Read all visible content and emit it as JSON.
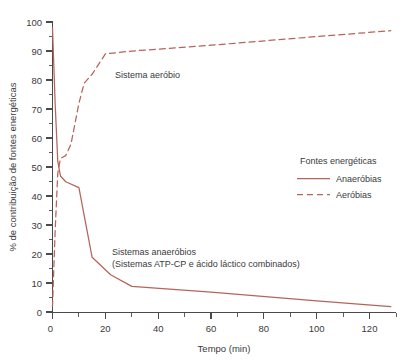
{
  "chart_data": {
    "type": "line",
    "title": "",
    "xlabel": "Tempo (min)",
    "ylabel": "% de contribuição de fontes energéticas",
    "xlim": [
      0,
      130
    ],
    "ylim": [
      0,
      100
    ],
    "grid": false,
    "xticks": [
      0,
      20,
      40,
      60,
      80,
      100,
      120
    ],
    "xtick_labels": [
      "0",
      "20",
      "40",
      "60",
      "80",
      "100",
      "120"
    ],
    "xticks_minor": [
      10,
      30,
      50,
      70,
      90,
      110
    ],
    "yticks": [
      0,
      10,
      20,
      30,
      40,
      50,
      60,
      70,
      80,
      90,
      100
    ],
    "ytick_labels": [
      "0",
      "10",
      "20",
      "30",
      "40",
      "50",
      "60",
      "70",
      "80",
      "90",
      "100"
    ],
    "yticks_minor": [
      5,
      15,
      25,
      35,
      45,
      55,
      65,
      75,
      85,
      95
    ],
    "legend_title": "Fontes energéticas",
    "legend_position": "right-middle",
    "series": [
      {
        "name": "Anaeróbias",
        "style": "solid",
        "color": "#b5645a",
        "points": [
          [
            0,
            98
          ],
          [
            1,
            72
          ],
          [
            2,
            52
          ],
          [
            3,
            47
          ],
          [
            5,
            45
          ],
          [
            10,
            43
          ],
          [
            15,
            19
          ],
          [
            22,
            13
          ],
          [
            30,
            9
          ],
          [
            60,
            7
          ],
          [
            100,
            4
          ],
          [
            128,
            2
          ]
        ]
      },
      {
        "name": "Aeróbias",
        "style": "dashed",
        "color": "#b5645a",
        "points": [
          [
            0,
            2
          ],
          [
            1,
            28
          ],
          [
            2,
            48
          ],
          [
            3,
            53
          ],
          [
            5,
            54
          ],
          [
            7,
            58
          ],
          [
            10,
            72
          ],
          [
            12,
            79
          ],
          [
            15,
            82
          ],
          [
            20,
            89
          ],
          [
            30,
            90
          ],
          [
            60,
            92
          ],
          [
            100,
            95
          ],
          [
            128,
            97
          ]
        ]
      }
    ],
    "annotations": [
      {
        "name": "aerobic-label",
        "lines": [
          "Sistema aeróbio"
        ],
        "x": 115,
        "y": 78
      },
      {
        "name": "anaerobic-label",
        "lines": [
          "Sistemas anaeróbios",
          "(Sistemas ATP-CP e ácido láctico combinados)"
        ],
        "x": 112,
        "y": 255
      }
    ]
  }
}
